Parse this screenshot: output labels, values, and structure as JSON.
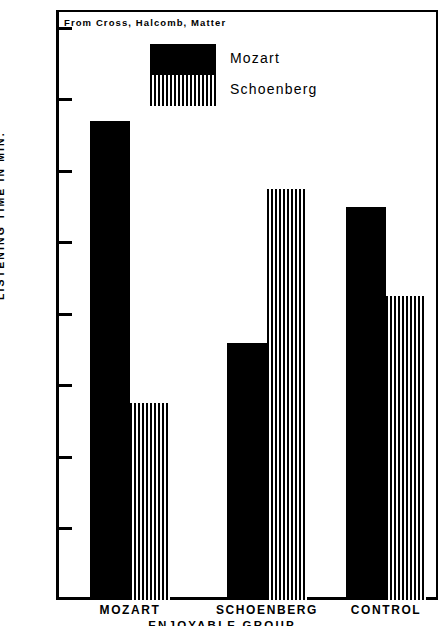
{
  "figure": {
    "source_note": "From   Cross, Halcomb, Matter",
    "y_axis_title": "LISTENING  TIME  IN  MIN.",
    "x_axis_caption": "ENJOYABLE  GROUP"
  },
  "legend": {
    "entries": [
      {
        "label": "Mozart",
        "pattern": "solid",
        "color": "#000000"
      },
      {
        "label": "Schoenberg",
        "pattern": "striped",
        "color": "#000000"
      }
    ]
  },
  "chart_data": {
    "type": "bar",
    "title": "",
    "subtitle": "From   Cross, Halcomb, Matter",
    "xlabel": "ENJOYABLE  GROUP",
    "ylabel": "LISTENING  TIME  IN  MIN.",
    "categories": [
      "MOZART",
      "SCHOENBERG",
      "CONTROL"
    ],
    "series": [
      {
        "name": "Mozart",
        "pattern": "solid",
        "values": [
          16.7,
          13.6,
          15.5
        ]
      },
      {
        "name": "Schoenberg",
        "pattern": "striped",
        "values": [
          12.75,
          15.75,
          14.25
        ]
      }
    ],
    "ylim": [
      10,
      18
    ],
    "yticks": [
      10,
      11,
      12,
      13,
      14,
      15,
      16,
      "1",
      18
    ],
    "ytick_labels": [
      "10",
      "11",
      "12",
      "13",
      "14",
      "15",
      "16",
      "1",
      "18"
    ],
    "grid": false,
    "legend_position": "upper-center"
  },
  "axis": {
    "ticks": [
      {
        "label": "18",
        "value": 18
      },
      {
        "label": "1",
        "value": 17
      },
      {
        "label": "16",
        "value": 16
      },
      {
        "label": "15",
        "value": 15
      },
      {
        "label": "14",
        "value": 14
      },
      {
        "label": "13",
        "value": 13
      },
      {
        "label": "12",
        "value": 12
      },
      {
        "label": "11",
        "value": 11
      },
      {
        "label": "10",
        "value": 10
      }
    ]
  },
  "groups": [
    {
      "label": "MOZART"
    },
    {
      "label": "SCHOENBERG"
    },
    {
      "label": "CONTROL"
    }
  ]
}
